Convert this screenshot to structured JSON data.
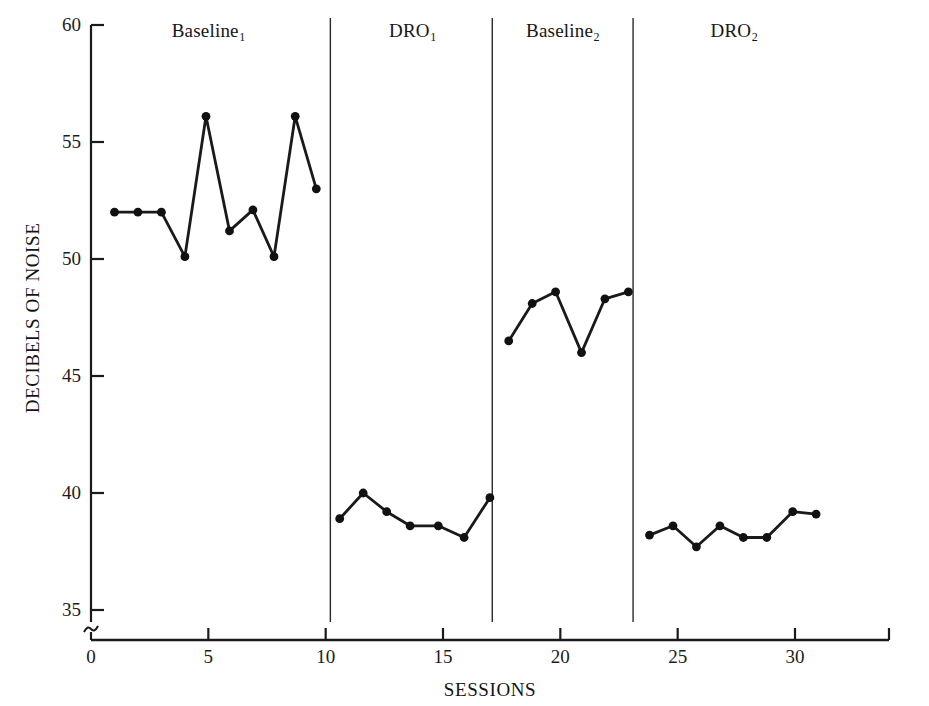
{
  "figure": {
    "background_color": "#ffffff",
    "line_color": "#1a1a1a",
    "marker_color": "#111111"
  },
  "axes": {
    "y_title": "DECIBELS OF NOISE",
    "x_title": "SESSIONS",
    "y_ticks": [
      35,
      40,
      45,
      50,
      55,
      60
    ],
    "x_ticks": [
      0,
      5,
      10,
      15,
      20,
      25,
      30
    ],
    "axis_break_symbol": "≈"
  },
  "phases": [
    {
      "label": "Baseline",
      "subscript": "1",
      "center_session": 5.0
    },
    {
      "label": "DRO",
      "subscript": "1",
      "center_session": 13.7
    },
    {
      "label": "Baseline",
      "subscript": "2",
      "center_session": 20.1
    },
    {
      "label": "DRO",
      "subscript": "2",
      "center_session": 27.4
    }
  ],
  "phase_dividers": [
    10.2,
    17.1,
    23.1
  ],
  "chart_data": {
    "type": "line",
    "title": "",
    "xlabel": "SESSIONS",
    "ylabel": "DECIBELS OF NOISE",
    "xlim": [
      0,
      32
    ],
    "ylim": [
      34.5,
      60
    ],
    "grid": false,
    "legend": "none",
    "y_axis_broken_below": 35,
    "x_tick_values": [
      0,
      5,
      10,
      15,
      20,
      25,
      30
    ],
    "y_tick_values": [
      35,
      40,
      45,
      50,
      55,
      60
    ],
    "series": [
      {
        "name": "Baseline1",
        "phase": "Baseline₁",
        "x": [
          1,
          2,
          3,
          4,
          4.9,
          5.9,
          6.9,
          7.8,
          8.7,
          9.6
        ],
        "values": [
          52.0,
          52.0,
          52.0,
          50.1,
          56.1,
          51.2,
          52.1,
          50.1,
          56.1,
          53.0
        ]
      },
      {
        "name": "DRO1",
        "phase": "DRO₁",
        "x": [
          10.6,
          11.6,
          12.6,
          13.6,
          14.8,
          15.9,
          17.0
        ],
        "values": [
          38.9,
          40.0,
          39.2,
          38.6,
          38.6,
          38.1,
          39.8
        ]
      },
      {
        "name": "Baseline2",
        "phase": "Baseline₂",
        "x": [
          17.8,
          18.8,
          19.8,
          20.9,
          21.9,
          22.9
        ],
        "values": [
          46.5,
          48.1,
          48.6,
          46.0,
          48.3,
          48.6
        ]
      },
      {
        "name": "DRO2",
        "phase": "DRO₂",
        "x": [
          23.8,
          24.8,
          25.8,
          26.8,
          27.8,
          28.8,
          29.9,
          30.9
        ],
        "values": [
          38.2,
          38.6,
          37.7,
          38.6,
          38.1,
          38.1,
          39.2,
          39.1
        ]
      }
    ]
  }
}
